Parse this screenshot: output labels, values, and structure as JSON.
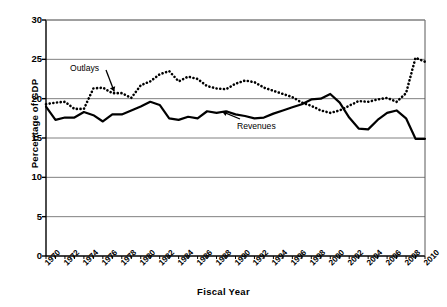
{
  "figure": {
    "background": "#ffffff",
    "line_color": "#000000",
    "grid_color": "#808080",
    "axis_color": "#595959"
  },
  "axes": {
    "xlabel": "Fiscal Year",
    "ylabel": "Percentage of GDP",
    "ylim": [
      0,
      30
    ],
    "ytick_values": [
      0,
      5,
      10,
      15,
      20,
      25,
      30
    ],
    "ytick_labels": [
      "0",
      "5",
      "10",
      "15",
      "20",
      "25",
      "30"
    ],
    "xlim": [
      1970,
      2010
    ],
    "xtick_values": [
      1970,
      1972,
      1974,
      1976,
      1978,
      1980,
      1982,
      1984,
      1986,
      1988,
      1990,
      1992,
      1994,
      1996,
      1998,
      2000,
      2002,
      2004,
      2006,
      2008,
      2010
    ],
    "xtick_labels": [
      "1970",
      "1972",
      "1974",
      "1976",
      "1978",
      "1980",
      "1982",
      "1984",
      "1986",
      "1988",
      "1990",
      "1992",
      "1994",
      "1996",
      "1998",
      "2000",
      "2002",
      "2004",
      "2006",
      "2008",
      "2010"
    ],
    "grid": "horizontal"
  },
  "annotations": [
    {
      "name": "outlays",
      "text": "Outlays",
      "arrow": "down-right"
    },
    {
      "name": "revenues",
      "text": "Revenues",
      "arrow": "up-left"
    }
  ],
  "chart_data": {
    "type": "line",
    "title": "",
    "subtitle": "",
    "xlabel": "Fiscal Year",
    "ylabel": "Percentage of GDP",
    "xlim": [
      1970,
      2010
    ],
    "ylim": [
      0,
      30
    ],
    "grid": true,
    "legend": "inline-annotations",
    "x": [
      1970,
      1971,
      1972,
      1973,
      1974,
      1975,
      1976,
      1977,
      1978,
      1979,
      1980,
      1981,
      1982,
      1983,
      1984,
      1985,
      1986,
      1987,
      1988,
      1989,
      1990,
      1991,
      1992,
      1993,
      1994,
      1995,
      1996,
      1997,
      1998,
      1999,
      2000,
      2001,
      2002,
      2003,
      2004,
      2005,
      2006,
      2007,
      2008,
      2009,
      2010
    ],
    "series": [
      {
        "name": "Outlays",
        "style": "dotted",
        "values": [
          19.3,
          19.5,
          19.6,
          18.7,
          18.7,
          21.3,
          21.4,
          20.7,
          20.7,
          20.1,
          21.7,
          22.2,
          23.1,
          23.5,
          22.2,
          22.8,
          22.5,
          21.6,
          21.3,
          21.2,
          21.9,
          22.3,
          22.1,
          21.4,
          21.0,
          20.6,
          20.2,
          19.5,
          19.1,
          18.5,
          18.2,
          18.5,
          19.1,
          19.7,
          19.6,
          19.9,
          20.1,
          19.6,
          20.7,
          25.2,
          24.7
        ]
      },
      {
        "name": "Revenues",
        "style": "solid",
        "values": [
          19.0,
          17.3,
          17.6,
          17.6,
          18.3,
          17.9,
          17.1,
          18.0,
          18.0,
          18.5,
          19.0,
          19.6,
          19.2,
          17.5,
          17.3,
          17.7,
          17.5,
          18.4,
          18.2,
          18.4,
          18.0,
          17.8,
          17.5,
          17.6,
          18.1,
          18.5,
          18.9,
          19.3,
          19.9,
          20.0,
          20.6,
          19.5,
          17.6,
          16.2,
          16.1,
          17.3,
          18.2,
          18.5,
          17.5,
          14.9,
          14.9
        ]
      }
    ]
  }
}
